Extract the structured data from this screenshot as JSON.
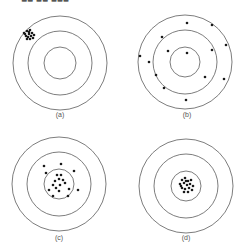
{
  "header": {
    "partial_title": "■■ ■■ ■■■"
  },
  "colors": {
    "ring": "#6e6e6e",
    "shot": "#1a1a1a",
    "caption": "#555555",
    "background": "#ffffff"
  },
  "panels": [
    {
      "id": "a",
      "caption": "(a)",
      "description": "precise but not accurate",
      "center": [
        60,
        63
      ],
      "radii": [
        47,
        32,
        16
      ],
      "caption_pos": [
        60,
        117
      ],
      "shots": [
        [
          24,
          33
        ],
        [
          27,
          31
        ],
        [
          29,
          34
        ],
        [
          26,
          36
        ],
        [
          30,
          30
        ],
        [
          32,
          33
        ],
        [
          28,
          37
        ],
        [
          31,
          36
        ],
        [
          34,
          35
        ],
        [
          27,
          39
        ],
        [
          30,
          39
        ],
        [
          33,
          38
        ],
        [
          25,
          34
        ],
        [
          29,
          32
        ]
      ]
    },
    {
      "id": "b",
      "caption": "(b)",
      "description": "neither precise nor accurate",
      "center": [
        185,
        62
      ],
      "radii": [
        47,
        32,
        15
      ],
      "caption_pos": [
        187,
        117
      ],
      "shots": [
        [
          187,
          23
        ],
        [
          212,
          25
        ],
        [
          162,
          37
        ],
        [
          226,
          45
        ],
        [
          168,
          51
        ],
        [
          187,
          53
        ],
        [
          212,
          50
        ],
        [
          140,
          56
        ],
        [
          149,
          62
        ],
        [
          156,
          75
        ],
        [
          205,
          77
        ],
        [
          224,
          79
        ],
        [
          164,
          88
        ],
        [
          186,
          100
        ]
      ]
    },
    {
      "id": "c",
      "caption": "(c)",
      "description": "accurate but not precise",
      "center": [
        59,
        184
      ],
      "radii": [
        47,
        32,
        15
      ],
      "caption_pos": [
        59,
        240
      ],
      "shots": [
        [
          44,
          166
        ],
        [
          61,
          164
        ],
        [
          74,
          171
        ],
        [
          46,
          173
        ],
        [
          57,
          175
        ],
        [
          61,
          175
        ],
        [
          55,
          181
        ],
        [
          59,
          179
        ],
        [
          63,
          180
        ],
        [
          65,
          183
        ],
        [
          53,
          185
        ],
        [
          60,
          185
        ],
        [
          49,
          190
        ],
        [
          59,
          191
        ],
        [
          69,
          189
        ],
        [
          78,
          190
        ],
        [
          53,
          196
        ],
        [
          68,
          196
        ],
        [
          56,
          188
        ]
      ]
    },
    {
      "id": "d",
      "caption": "(d)",
      "description": "precise and accurate",
      "center": [
        186,
        186
      ],
      "radii": [
        47,
        32,
        15
      ],
      "caption_pos": [
        186,
        240
      ],
      "shots": [
        [
          182,
          180
        ],
        [
          185,
          178
        ],
        [
          188,
          181
        ],
        [
          191,
          180
        ],
        [
          180,
          184
        ],
        [
          184,
          183
        ],
        [
          187,
          185
        ],
        [
          190,
          184
        ],
        [
          193,
          186
        ],
        [
          182,
          188
        ],
        [
          185,
          189
        ],
        [
          189,
          188
        ],
        [
          192,
          190
        ],
        [
          184,
          192
        ],
        [
          188,
          192
        ],
        [
          181,
          186
        ],
        [
          186,
          181
        ]
      ]
    }
  ]
}
